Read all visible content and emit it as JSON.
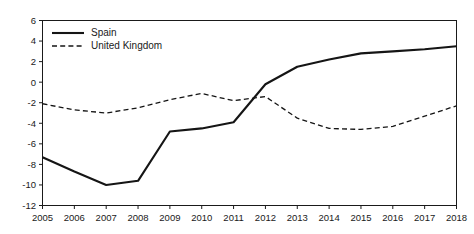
{
  "chart_data": {
    "type": "line",
    "title": "",
    "subtitle": "",
    "xlabel": "",
    "ylabel": "",
    "x": [
      2005,
      2006,
      2007,
      2008,
      2009,
      2010,
      2011,
      2012,
      2013,
      2014,
      2015,
      2016,
      2017,
      2018
    ],
    "categories": [
      "2005",
      "2006",
      "2007",
      "2008",
      "2009",
      "2010",
      "2011",
      "2012",
      "2013",
      "2014",
      "2015",
      "2016",
      "2017",
      "2018"
    ],
    "series": [
      {
        "name": "Spain",
        "style": "solid",
        "color": "#151515",
        "values": [
          -7.3,
          -8.7,
          -10.0,
          -9.6,
          -4.8,
          -4.5,
          -3.9,
          -0.2,
          1.5,
          2.2,
          2.8,
          3.0,
          3.2,
          3.5
        ]
      },
      {
        "name": "United Kingdom",
        "style": "dashed",
        "color": "#151515",
        "values": [
          -2.1,
          -2.7,
          -3.0,
          -2.5,
          -1.7,
          -1.1,
          -1.8,
          -1.4,
          -3.5,
          -4.5,
          -4.6,
          -4.3,
          -3.3,
          -2.3
        ]
      }
    ],
    "ylim": [
      -12,
      6
    ],
    "yticks": [
      6,
      4,
      2,
      0,
      -2,
      -4,
      -6,
      -8,
      -10,
      -12
    ],
    "ytick_labels": [
      "6",
      "4",
      "2",
      "0",
      "-2",
      "-4",
      "-6",
      "-8",
      "-10",
      "-12"
    ],
    "xlim": [
      2005,
      2018
    ],
    "xticks": [
      2005,
      2006,
      2007,
      2008,
      2009,
      2010,
      2011,
      2012,
      2013,
      2014,
      2015,
      2016,
      2017,
      2018
    ],
    "grid": false,
    "legend_position": "top-left",
    "legend_entries": [
      "Spain",
      "United Kingdom"
    ]
  },
  "legend": {
    "spain_label": "Spain",
    "uk_label": "United Kingdom"
  }
}
